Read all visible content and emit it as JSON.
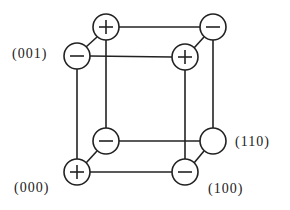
{
  "diagram": {
    "type": "cube-vertex-signs",
    "stroke_color": "#222222",
    "vertices": [
      {
        "id": "back-top-left",
        "cx": 106,
        "cy": 27,
        "sign": "+"
      },
      {
        "id": "back-top-right",
        "cx": 213,
        "cy": 27,
        "sign": "-"
      },
      {
        "id": "front-top-left",
        "cx": 77,
        "cy": 56,
        "sign": "-",
        "label": "(001)"
      },
      {
        "id": "front-top-right",
        "cx": 185,
        "cy": 57,
        "sign": "+"
      },
      {
        "id": "back-bottom-left",
        "cx": 106,
        "cy": 141,
        "sign": "-"
      },
      {
        "id": "back-bottom-right",
        "cx": 213,
        "cy": 141,
        "sign": "",
        "label": "(110)"
      },
      {
        "id": "front-bottom-left",
        "cx": 77,
        "cy": 172,
        "sign": "+",
        "label": "(000)"
      },
      {
        "id": "front-bottom-right",
        "cx": 185,
        "cy": 172,
        "sign": "-",
        "label": "(100)"
      }
    ],
    "labels": {
      "v001": "(001)",
      "v110": "(110)",
      "v000": "(000)",
      "v100": "(100)"
    }
  }
}
